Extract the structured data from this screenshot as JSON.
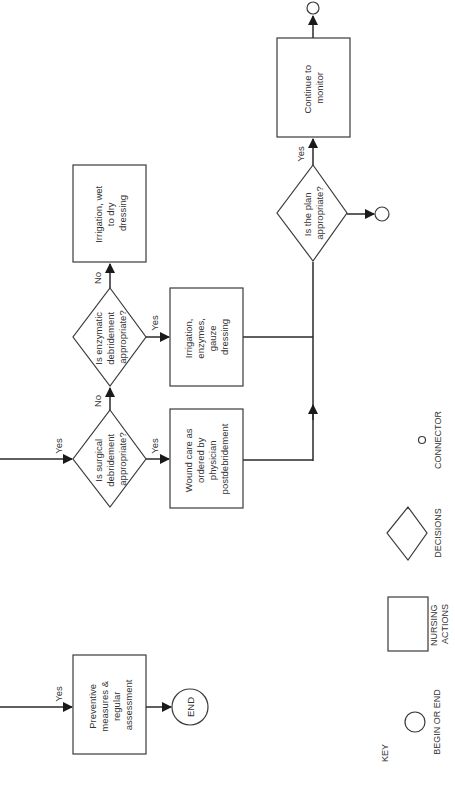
{
  "diagram": {
    "orientation": "rotated-90-ccw",
    "nodes": {
      "continue_monitor": {
        "type": "nursing-action",
        "lines": [
          "Continue to",
          "monitor"
        ]
      },
      "plan_appropriate": {
        "type": "decision",
        "lines": [
          "Is the plan",
          "appropriate?"
        ]
      },
      "irrigation_wet_dry": {
        "type": "nursing-action",
        "lines": [
          "Irrigation, wet",
          "to dry",
          "dressing"
        ]
      },
      "enzymatic_decision": {
        "type": "decision",
        "lines": [
          "Is enzymatic",
          "debridement",
          "appropriate?"
        ]
      },
      "irrigation_enzymes": {
        "type": "nursing-action",
        "lines": [
          "Irrigation,",
          "enzymes,",
          "gauze",
          "dressing"
        ]
      },
      "surgical_decision": {
        "type": "decision",
        "lines": [
          "Is surgical",
          "debridement",
          "appropriate?"
        ]
      },
      "wound_care": {
        "type": "nursing-action",
        "lines": [
          "Wound care as",
          "ordered by",
          "physician",
          "postdebridement"
        ]
      },
      "preventive": {
        "type": "nursing-action",
        "lines": [
          "Preventive",
          "measures &",
          "regular",
          "assessment"
        ]
      },
      "end": {
        "type": "begin-end",
        "label": "END"
      }
    },
    "edge_labels": {
      "plan_yes": "Yes",
      "enzymatic_no": "No",
      "enzymatic_yes": "Yes",
      "surgical_no": "No",
      "surgical_yes": "Yes",
      "surgical_in_yes": "Yes",
      "preventive_in_yes": "Yes"
    },
    "key": {
      "title": "KEY",
      "items": [
        {
          "shape": "circle",
          "lines": [
            "BEGIN OR END"
          ]
        },
        {
          "shape": "rectangle",
          "lines": [
            "NURSING",
            "ACTIONS"
          ]
        },
        {
          "shape": "diamond",
          "lines": [
            "DECISIONS"
          ]
        },
        {
          "shape": "small-circle",
          "lines": [
            "CONNECTOR"
          ]
        }
      ]
    }
  }
}
